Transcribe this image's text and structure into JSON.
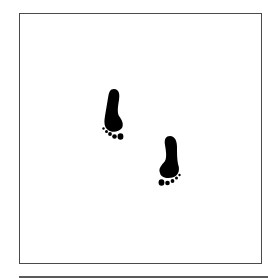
{
  "image": {
    "description": "Two black footprints inside a square frame",
    "frame_color": "#4a4a4a",
    "background_color": "#ffffff",
    "ink_color": "#000000"
  },
  "footprints": [
    {
      "name": "footprint-left",
      "side": "left",
      "x": 114,
      "y": 113
    },
    {
      "name": "footprint-right",
      "side": "right",
      "x": 170,
      "y": 160
    }
  ]
}
